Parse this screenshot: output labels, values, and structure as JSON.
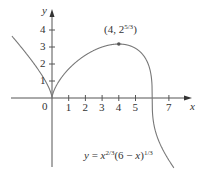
{
  "chart_data": {
    "type": "line",
    "title": "",
    "xlabel": "x",
    "ylabel": "y",
    "function": "y = x^(2/3) (6 - x)^(1/3)",
    "x_ticks": [
      "1",
      "2",
      "3",
      "4",
      "5",
      "7"
    ],
    "x_tick_values": [
      1,
      2,
      3,
      4,
      5,
      7
    ],
    "y_ticks": [
      "1",
      "2",
      "3",
      "4"
    ],
    "y_tick_values": [
      1,
      2,
      3,
      4
    ],
    "origin_label": "0",
    "xlim": [
      -2.45,
      8.1
    ],
    "ylim": [
      -4.2,
      5.2
    ],
    "grid": false,
    "annotations": [
      {
        "text": "(4, 2^(5/3))",
        "x": 4,
        "y": 3.175,
        "marker": true
      }
    ],
    "series": [
      {
        "name": "y = x^(2/3)(6 - x)^(1/3)",
        "x": [
          -2.4,
          -2.0,
          -1.5,
          -1.0,
          -0.6,
          -0.3,
          -0.1,
          0,
          0.1,
          0.3,
          0.6,
          1.0,
          1.5,
          2.0,
          2.5,
          3.0,
          3.5,
          4.0,
          4.5,
          5.0,
          5.4,
          5.7,
          5.9,
          6.0,
          6.1,
          6.3,
          6.6,
          7.0,
          7.3
        ],
        "y": [
          3.64,
          3.17,
          2.58,
          1.91,
          1.35,
          0.82,
          0.39,
          0,
          0.39,
          0.8,
          1.27,
          1.71,
          2.16,
          2.52,
          2.81,
          3.02,
          3.15,
          3.17,
          3.08,
          2.92,
          2.6,
          2.21,
          1.54,
          0,
          -1.0,
          -1.63,
          -2.56,
          -3.66,
          -4.1
        ]
      }
    ]
  },
  "labels": {
    "y_axis": "y",
    "x_axis": "x",
    "origin": "0",
    "point_label_base": "(4, 2",
    "point_label_exp": "5/3",
    "point_label_close": ")",
    "eq_y": "y",
    "eq_eq": " = ",
    "eq_x": "x",
    "eq_exp1": "2/3",
    "eq_mid": "(6 − ",
    "eq_x2": "x",
    "eq_close": ")",
    "eq_exp2": "1/3"
  }
}
